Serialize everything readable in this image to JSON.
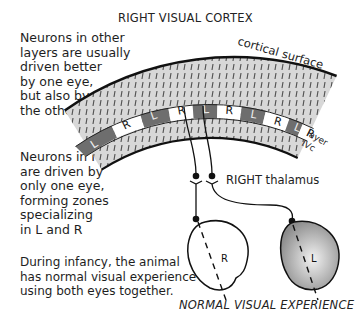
{
  "title": "RIGHT VISUAL CORTEX",
  "labels": {
    "cortical_surface": "cortical surface",
    "layer": "layer",
    "ivc": "IVc",
    "thalamus": "RIGHT thalamus",
    "caption": "NORMAL VISUAL EXPERIENCE",
    "eye_right": "R",
    "eye_left": "L"
  },
  "notes": {
    "other_layers": "Neurons in other\nlayers are usually\ndriven better\nby one eye,\nbut also by\nthe other.",
    "layer_ivc": "Neurons in IVc\nare driven by\nonly one eye,\nforming zones\nspecializing\nin L and R",
    "infancy": "During infancy, the animal\nhas normal visual experience\nusing both eyes together."
  },
  "ocular_dominance_columns": [
    "L",
    "R",
    "L",
    "R",
    "L",
    "R",
    "L",
    "R",
    "L",
    "R"
  ],
  "colors": {
    "cortex_fill": "#d9d9d9",
    "left_zone": "#6e6e6e",
    "right_zone": "#ffffff",
    "eye_left_fill": "#9a9a9a",
    "outline": "#111111"
  }
}
